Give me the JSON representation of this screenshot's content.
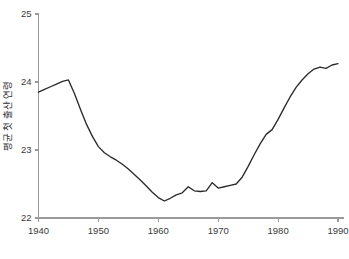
{
  "chart_data": {
    "type": "line",
    "title": "",
    "xlabel": "",
    "ylabel": "평균 첫 출산 연령",
    "xlim": [
      1940,
      1991
    ],
    "ylim": [
      22,
      25
    ],
    "grid": false,
    "legend": false,
    "x_ticks": [
      "1940",
      "1950",
      "1960",
      "1970",
      "1980",
      "1990"
    ],
    "x_tick_values": [
      1940,
      1950,
      1960,
      1970,
      1980,
      1990
    ],
    "y_ticks": [
      "22",
      "23",
      "24",
      "25"
    ],
    "y_tick_values": [
      22,
      23,
      24,
      25
    ],
    "line_color": "#2b2b2b",
    "axis_color": "#9a9a9a",
    "background_color": "#ffffff",
    "series": [
      {
        "name": "평균 첫 출산 연령",
        "x": [
          1940,
          1941,
          1942,
          1943,
          1944,
          1945,
          1946,
          1947,
          1948,
          1949,
          1950,
          1951,
          1952,
          1953,
          1954,
          1955,
          1956,
          1957,
          1958,
          1959,
          1960,
          1961,
          1962,
          1963,
          1964,
          1965,
          1966,
          1967,
          1968,
          1969,
          1970,
          1971,
          1972,
          1973,
          1974,
          1975,
          1976,
          1977,
          1978,
          1979,
          1980,
          1981,
          1982,
          1983,
          1984,
          1985,
          1986,
          1987,
          1988,
          1989,
          1990
        ],
        "values": [
          23.85,
          23.89,
          23.93,
          23.97,
          24.01,
          24.03,
          23.83,
          23.6,
          23.38,
          23.2,
          23.05,
          22.96,
          22.9,
          22.85,
          22.79,
          22.72,
          22.64,
          22.56,
          22.47,
          22.38,
          22.3,
          22.25,
          22.29,
          22.34,
          22.37,
          22.46,
          22.4,
          22.39,
          22.4,
          22.52,
          22.44,
          22.46,
          22.48,
          22.5,
          22.6,
          22.76,
          22.93,
          23.09,
          23.23,
          23.3,
          23.45,
          23.62,
          23.78,
          23.92,
          24.03,
          24.12,
          24.19,
          24.22,
          24.2,
          24.25,
          24.27
        ]
      }
    ]
  }
}
